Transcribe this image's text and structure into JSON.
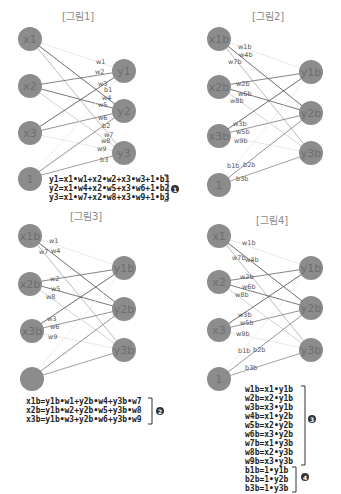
{
  "top_strip_text": "· · · · · · · · · · · · · · · · · · · · · · · · · · · · · · ·",
  "figures": [
    {
      "title": "[그림1]",
      "inputs": [
        "x1",
        "x2",
        "x3",
        "1"
      ],
      "outputs": [
        "y1",
        "y2",
        "y3"
      ],
      "weights": [
        "w1",
        "w2",
        "w3",
        "w4",
        "w5",
        "w6",
        "w7",
        "w8",
        "w9",
        "b1",
        "b2",
        "b3"
      ],
      "equations": [
        "y1=x1•w1+x2•w2+x3•w3+1•b1",
        "y2=x1•w4+x2•w5+x3•w6+1•b2",
        "y3=x1•w7+x2•w8+x3•w9+1•b3"
      ],
      "badge": "1"
    },
    {
      "title": "[그림2]",
      "inputs": [
        "x1b",
        "x2b",
        "x3b",
        "1"
      ],
      "outputs": [
        "y1b",
        "y2b",
        "y3b"
      ],
      "weights": [
        "w1b",
        "w4b",
        "w7b",
        "w2b",
        "w6b",
        "w8b",
        "w3b",
        "w5b",
        "w9b",
        "b1b",
        "b2b",
        "b3b"
      ]
    },
    {
      "title": "[그림3]",
      "inputs": [
        "x1b",
        "x2b",
        "x3b",
        ""
      ],
      "outputs": [
        "y1b",
        "y2b",
        "y3b"
      ],
      "weights": [
        "w1",
        "w7",
        "w4",
        "w2",
        "w5",
        "w8",
        "w3",
        "w6",
        "w9"
      ],
      "equations": [
        "x1b=y1b•w1+y2b•w4+y3b•w7",
        "x2b=y1b•w2+y2b•w5+y3b•w8",
        "x3b=y1b•w3+y2b•w6+y3b•w9"
      ],
      "badge": "2"
    },
    {
      "title": "[그림4]",
      "inputs": [
        "x1",
        "x2",
        "x3",
        "1"
      ],
      "outputs": [
        "y1b",
        "y2b",
        "y3b"
      ],
      "weights": [
        "w1b",
        "w7b",
        "w4b",
        "w2b",
        "w6b",
        "w8b",
        "w3b",
        "w5b",
        "w9b",
        "b1b",
        "b2b",
        "b3b"
      ],
      "equations_w": [
        "w1b=x1•y1b",
        "w2b=x2•y1b",
        "w3b=x3•y1b",
        "w4b=x1•y2b",
        "w5b=x2•y2b",
        "w6b=x3•y2b",
        "w7b=x1•y3b",
        "w8b=x2•y3b",
        "w9b=x3•y3b"
      ],
      "equations_b": [
        "b1b=1•y1b",
        "b2b=1•y2b",
        "b3b=1•y3b"
      ],
      "badge_w": "3",
      "badge_b": "4"
    }
  ],
  "colors": {
    "node": "#8c8c8c",
    "node_text": "#6e6e6e",
    "edge_dark": "#444444",
    "edge_mid": "#888888",
    "edge_light": "#c8c8c8",
    "equation_text": "#222222"
  }
}
